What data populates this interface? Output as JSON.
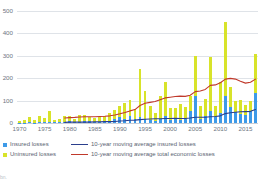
{
  "chart_data": {
    "type": "bar",
    "title": "",
    "subtitle": "",
    "xlabel": "",
    "ylabel": "",
    "ylim": [
      0,
      500
    ],
    "yticks": [
      0,
      100,
      200,
      300,
      400,
      500
    ],
    "xticks": [
      "1970",
      "1975",
      "1980",
      "1985",
      "1990",
      "1995",
      "2000",
      "2005",
      "2010",
      "2015"
    ],
    "grid": true,
    "legend_position": "below-plot",
    "stacked": true,
    "x": [
      1970,
      1971,
      1972,
      1973,
      1974,
      1975,
      1976,
      1977,
      1978,
      1979,
      1980,
      1981,
      1982,
      1983,
      1984,
      1985,
      1986,
      1987,
      1988,
      1989,
      1990,
      1991,
      1992,
      1993,
      1994,
      1995,
      1996,
      1997,
      1998,
      1999,
      2000,
      2001,
      2002,
      2003,
      2004,
      2005,
      2006,
      2007,
      2008,
      2009,
      2010,
      2011,
      2012,
      2013,
      2014,
      2015,
      2016,
      2017
    ],
    "series": [
      {
        "name": "Insured losses",
        "type": "bar",
        "color": "#3d9ae8",
        "values": [
          2,
          2,
          3,
          2,
          3,
          3,
          4,
          3,
          3,
          5,
          8,
          5,
          6,
          9,
          7,
          6,
          5,
          9,
          8,
          18,
          27,
          19,
          33,
          20,
          27,
          17,
          15,
          10,
          20,
          33,
          14,
          20,
          14,
          20,
          54,
          120,
          20,
          30,
          52,
          28,
          45,
          120,
          70,
          47,
          40,
          38,
          55,
          132
        ]
      },
      {
        "name": "Uninsured losses",
        "type": "bar",
        "color": "#d8e32a",
        "values": [
          8,
          10,
          22,
          10,
          28,
          18,
          51,
          12,
          16,
          25,
          22,
          13,
          29,
          26,
          19,
          18,
          20,
          21,
          37,
          42,
          48,
          71,
          70,
          44,
          214,
          126,
          61,
          35,
          100,
          152,
          55,
          49,
          73,
          51,
          66,
          178,
          55,
          75,
          245,
          50,
          140,
          330,
          90,
          53,
          65,
          42,
          45,
          178
        ]
      },
      {
        "name": "10-year moving average insured losses",
        "type": "line",
        "color": "#2b3f8c",
        "values": [
          null,
          null,
          null,
          null,
          null,
          null,
          null,
          null,
          null,
          3,
          4,
          4,
          4,
          4,
          4,
          5,
          5,
          6,
          6,
          7,
          9,
          10,
          12,
          13,
          15,
          17,
          18,
          19,
          19,
          20,
          20,
          21,
          20,
          20,
          22,
          26,
          26,
          26,
          28,
          29,
          32,
          42,
          46,
          48,
          50,
          51,
          52,
          60
        ]
      },
      {
        "name": "10-year moving average total economic losses",
        "type": "line",
        "color": "#c0392b",
        "values": [
          null,
          null,
          null,
          null,
          null,
          null,
          null,
          null,
          null,
          22,
          24,
          25,
          27,
          28,
          28,
          28,
          29,
          30,
          32,
          36,
          41,
          47,
          54,
          60,
          78,
          88,
          92,
          96,
          104,
          112,
          115,
          118,
          120,
          119,
          124,
          140,
          143,
          150,
          168,
          170,
          180,
          196,
          199,
          196,
          186,
          178,
          182,
          196
        ]
      }
    ]
  },
  "axis": {
    "ytick_labels": [
      "0",
      "100",
      "200",
      "300",
      "400",
      "500"
    ],
    "xtick_labels": [
      "1970",
      "1975",
      "1980",
      "1985",
      "1990",
      "1995",
      "2000",
      "2005",
      "2010",
      "2015"
    ]
  },
  "legend": {
    "swatch_items": [
      {
        "label": "Insured losses",
        "marker": "square-swatch-blue",
        "color": "#3d9ae8"
      },
      {
        "label": "Uninsured losses",
        "marker": "square-swatch-yellow",
        "color": "#d8e32a"
      }
    ],
    "line_items": [
      {
        "label": "10-year moving average insured losses",
        "marker": "line-swatch-navy",
        "color": "#2b3f8c"
      },
      {
        "label": "10-year moving average total economic losses",
        "marker": "line-swatch-red",
        "color": "#c0392b"
      }
    ]
  },
  "footnote": {
    "text": "bn."
  }
}
